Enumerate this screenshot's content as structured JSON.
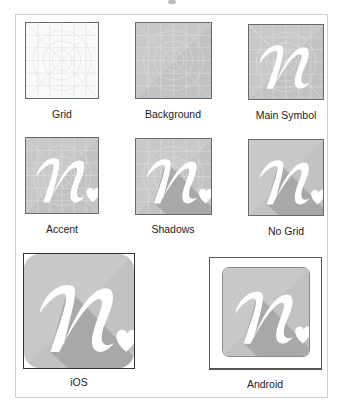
{
  "colors": {
    "tile_bg": "#c2c2c2",
    "tile_bg_light": "#d0d0d0",
    "grid_line": "#dedede",
    "shadow": "#9f9f9f",
    "symbol": "#ffffff",
    "border": "#6a6a6a"
  },
  "tiles": [
    {
      "label": "Grid",
      "layers": [
        "grid"
      ]
    },
    {
      "label": "Background",
      "layers": [
        "background",
        "grid"
      ]
    },
    {
      "label": "Main Symbol",
      "layers": [
        "background",
        "grid",
        "symbol"
      ]
    },
    {
      "label": "Accent",
      "layers": [
        "background",
        "grid",
        "symbol",
        "heart"
      ]
    },
    {
      "label": "Shadows",
      "layers": [
        "background",
        "grid",
        "shadow",
        "symbol",
        "heart"
      ]
    },
    {
      "label": "No Grid",
      "layers": [
        "background",
        "shadow",
        "symbol",
        "heart"
      ]
    }
  ],
  "platforms": [
    {
      "label": "iOS",
      "shape": "rounded-square"
    },
    {
      "label": "Android",
      "shape": "framed-rounded-square"
    }
  ],
  "icons": {
    "symbol": "letter-n-icon",
    "accent": "heart-icon"
  }
}
